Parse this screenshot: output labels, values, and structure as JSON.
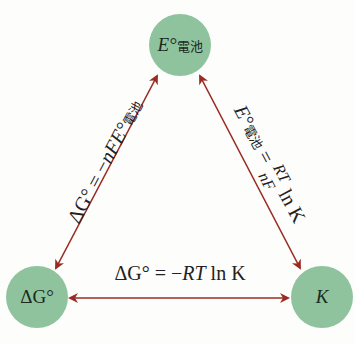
{
  "colors": {
    "node_fill": "#8fc39d",
    "arrow": "#9a2b22",
    "text": "#222222"
  },
  "nodes": {
    "top": {
      "main": "E°",
      "sub": "電池"
    },
    "bottom_left": {
      "main": "ΔG°"
    },
    "bottom_right": {
      "main": "K"
    }
  },
  "edges": {
    "left": {
      "prefix": "ΔG° = −",
      "var": "nFE°",
      "sub": "電池"
    },
    "right": {
      "lhs": "E°",
      "lhs_sub": "電池",
      "eq": " = ",
      "num": "RT",
      "den": "nF",
      "tail": " ln K"
    },
    "bottom": {
      "text_prefix": "ΔG° = −",
      "var": "RT",
      "tail": " ln K"
    }
  }
}
